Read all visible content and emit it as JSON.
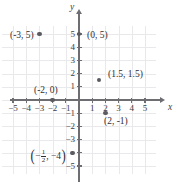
{
  "figure": {
    "type": "coordinate-plane",
    "axis_labels": {
      "x": "x",
      "y": "y"
    },
    "x_ticks": [
      "-5",
      "-4",
      "-3",
      "-2",
      "-1",
      "1",
      "2",
      "3",
      "4",
      "5"
    ],
    "y_ticks": [
      "5",
      "4",
      "3",
      "2",
      "1",
      "-1",
      "-2",
      "-3",
      "-5"
    ],
    "colors": {
      "grid": "#e9e9ec",
      "axis": "#6d6d72",
      "point": "#5a5a60",
      "text": "#2e2e33",
      "background": "#ffffff"
    }
  },
  "chart_data": {
    "type": "scatter",
    "title": "",
    "xlabel": "x",
    "ylabel": "y",
    "xlim": [
      -5.8,
      5.8
    ],
    "ylim": [
      -5.6,
      5.6
    ],
    "grid": true,
    "legend": "none",
    "points": [
      {
        "label": "(-3, 5)",
        "x": -3,
        "y": 5,
        "label_side": "left"
      },
      {
        "label": "(0, 5)",
        "x": 0,
        "y": 5,
        "label_side": "right"
      },
      {
        "label": "(1.5, 1.5)",
        "x": 1.5,
        "y": 1.5,
        "label_side": "right"
      },
      {
        "label": "(-2, 0)",
        "x": -2,
        "y": 0,
        "label_side": "above"
      },
      {
        "label": "(2, -1)",
        "x": 2,
        "y": -1,
        "label_side": "below"
      },
      {
        "label": "(-1/2, -4)",
        "x": -0.5,
        "y": -4,
        "label_side": "left",
        "label_parts": {
          "open": "(",
          "num": "1",
          "den": "2",
          "sign": "−",
          "rest": ", −4",
          "close": ")"
        }
      }
    ]
  }
}
